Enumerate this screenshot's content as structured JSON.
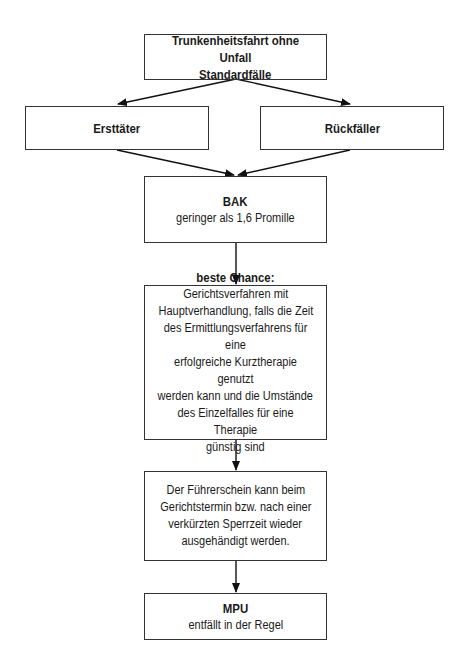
{
  "diagram": {
    "type": "flowchart",
    "nodes": {
      "root": {
        "title": "Trunkenheitsfahrt ohne Unfall",
        "body": "Standardfälle"
      },
      "first_offender": {
        "title": "Ersttäter"
      },
      "repeat_offender": {
        "title": "Rückfäller"
      },
      "bak": {
        "title": "BAK",
        "body": "geringer als 1,6 Promille"
      },
      "best_chance": {
        "title": "beste Chance:",
        "body_lines": [
          "Gerichtsverfahren mit",
          "Hauptverhandlung, falls die Zeit",
          "des Ermittlungsverfahrens für eine",
          "erfolgreiche Kurztherapie genutzt",
          "werden kann und die Umstände",
          "des Einzelfalles für eine Therapie",
          "günstig sind"
        ]
      },
      "license": {
        "body_lines": [
          "Der Führerschein kann beim",
          "Gerichtstermin bzw. nach einer",
          "verkürzten Sperrzeit wieder",
          "ausgehändigt werden."
        ]
      },
      "mpu": {
        "title": "MPU",
        "body": "entfällt in der Regel"
      }
    },
    "edges": [
      [
        "root",
        "first_offender"
      ],
      [
        "root",
        "repeat_offender"
      ],
      [
        "first_offender",
        "bak"
      ],
      [
        "repeat_offender",
        "bak"
      ],
      [
        "bak",
        "best_chance"
      ],
      [
        "best_chance",
        "license"
      ],
      [
        "license",
        "mpu"
      ]
    ]
  }
}
